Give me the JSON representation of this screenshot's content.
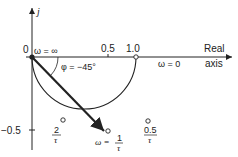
{
  "diagram": {
    "type": "polar-plot",
    "axes": {
      "imag_label": "j",
      "real_label_line1": "Real",
      "real_label_line2": "axis",
      "origin_label": "0",
      "tick_0_5": "0.5",
      "tick_1_0": "1.0",
      "tick_neg_0_5": "−0.5"
    },
    "annotations": {
      "omega_inf": "ω = ∞",
      "omega_zero": "ω = 0",
      "phi": "φ = −45°",
      "omega_one_tau_prefix": "ω =",
      "frac_one_num": "1",
      "frac_one_den": "τ",
      "frac_two_num": "2",
      "frac_two_den": "τ",
      "frac_half_num": "0.5",
      "frac_half_den": "τ"
    },
    "colors": {
      "line": "#222222",
      "background": "#ffffff"
    }
  }
}
